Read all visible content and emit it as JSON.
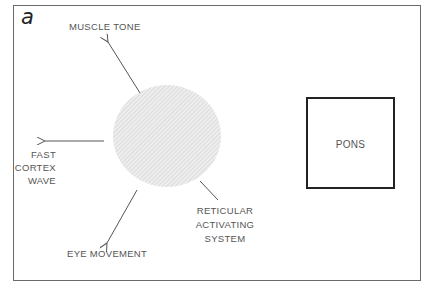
{
  "figure": {
    "panel_letter": "a",
    "nodes": {
      "center": {
        "label": "RETICULAR ACTIVATING SYSTEM",
        "lines": [
          "RETICULAR",
          "ACTIVATING",
          "SYSTEM"
        ],
        "shape": "hatched-ellipse",
        "fill": "#e6e6e6"
      },
      "pons": {
        "label": "PONS",
        "shape": "rectangle"
      }
    },
    "outputs": {
      "muscle_tone": "MUSCLE TONE",
      "fast_cortex_wave": {
        "lines": [
          "FAST",
          "CORTEX",
          "WAVE"
        ]
      },
      "eye_movement": "EYE MOVEMENT"
    },
    "colors": {
      "frame": "#6a6a6a",
      "arrow": "#555555",
      "pons_border": "#222222",
      "text": "#555555"
    }
  }
}
